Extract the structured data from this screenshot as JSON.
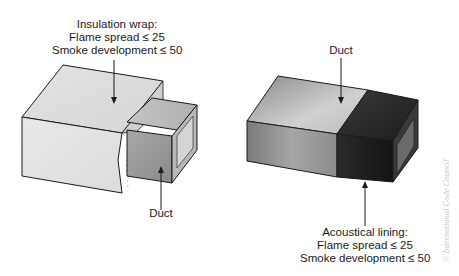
{
  "figure": {
    "left_panel": {
      "top_label": {
        "line1": "Insulation wrap:",
        "line2": "Flame spread ≤ 25",
        "line3": "Smoke development ≤ 50"
      },
      "bottom_label": "Duct"
    },
    "right_panel": {
      "top_label": "Duct",
      "bottom_label": {
        "line1": "Acoustical lining:",
        "line2": "Flame spread ≤ 25",
        "line3": "Smoke development ≤ 50"
      }
    },
    "credit": "© International Code Council",
    "colors": {
      "wrap_light": "#e6e6e6",
      "duct_mid": "#9a9a9a",
      "lining_dark": "#262626",
      "outline": "#1a1a1a"
    }
  }
}
